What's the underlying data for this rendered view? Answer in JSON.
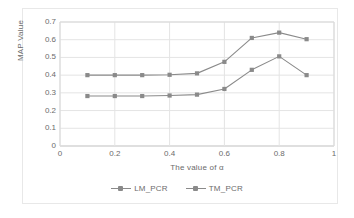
{
  "chart_data": {
    "type": "line",
    "title": "",
    "xlabel": "The value of α",
    "ylabel": "MAP Value",
    "x": [
      0.1,
      0.2,
      0.3,
      0.4,
      0.5,
      0.6,
      0.7,
      0.8,
      0.9
    ],
    "xlim": [
      0,
      1
    ],
    "ylim": [
      0,
      0.7
    ],
    "xticks": [
      "0",
      "0.2",
      "0.4",
      "0.6",
      "0.8",
      "1"
    ],
    "xtick_values": [
      0,
      0.2,
      0.4,
      0.6,
      0.8,
      1
    ],
    "yticks": [
      "0",
      "0.1",
      "0.2",
      "0.3",
      "0.4",
      "0.5",
      "0.6",
      "0.7"
    ],
    "ytick_values": [
      0,
      0.1,
      0.2,
      0.3,
      0.4,
      0.5,
      0.6,
      0.7
    ],
    "grid": "horizontal-and-vertical",
    "legend_position": "bottom",
    "series": [
      {
        "name": "LM_PCR",
        "color": "#8a8a8a",
        "marker": "square",
        "values": [
          0.4,
          0.4,
          0.4,
          0.402,
          0.41,
          0.475,
          0.61,
          0.64,
          0.603
        ]
      },
      {
        "name": "TM_PCR",
        "color": "#8a8a8a",
        "marker": "square",
        "values": [
          0.282,
          0.282,
          0.282,
          0.285,
          0.29,
          0.322,
          0.43,
          0.506,
          0.4
        ]
      }
    ]
  },
  "legend": {
    "items": [
      {
        "label": "LM_PCR"
      },
      {
        "label": "TM_PCR"
      }
    ]
  },
  "axes": {
    "y_title": "MAP Value",
    "x_title": "The value of α"
  },
  "colors": {
    "series": "#8a8a8a",
    "grid": "#e4e4e4",
    "text": "#6b6b6b",
    "frame": "#e8e8e8",
    "background": "#ffffff"
  }
}
